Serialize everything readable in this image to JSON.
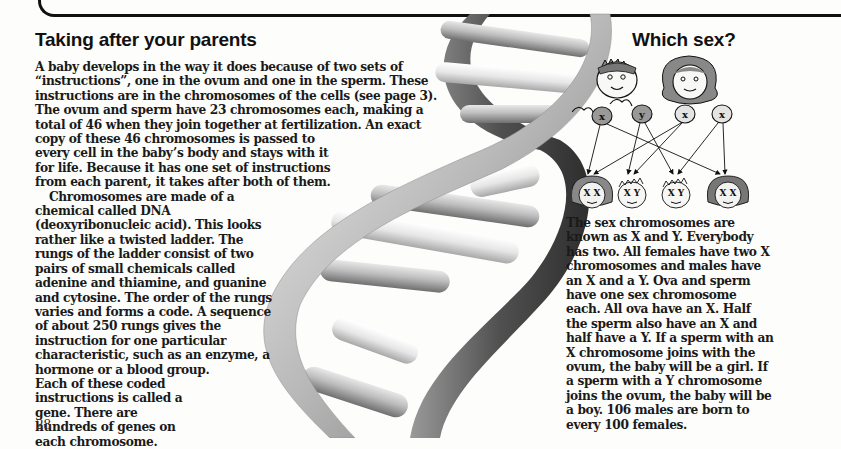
{
  "page": {
    "page_number": "28"
  },
  "main_article": {
    "heading": "Taking after your parents",
    "lines": [
      "A baby develops in the way it does because of two sets of",
      "“instructions”, one in the ovum and one in the sperm. These",
      "instructions are in the chromosomes of the cells (see page 3).",
      "The ovum and sperm have 23 chromosomes each, making a",
      "total of 46 when they join together at fertilization. An exact",
      "copy of these 46 chromosomes is passed to",
      "every cell in the baby’s body and stays with it",
      "for life. Because it has one set of instructions",
      "from each parent, it takes after both of them.",
      "Chromosomes are made of a",
      "chemical called DNA",
      "(deoxyribonucleic acid). This looks",
      "rather like a twisted ladder. The",
      "rungs of the ladder consist of two",
      "pairs of small chemicals called",
      "adenine and thiamine, and guanine",
      "and cytosine. The order of the rungs",
      "varies and forms a code. A sequence",
      "of about 250 rungs gives the",
      "instruction for one particular",
      "characteristic, such as an enzyme, a",
      "hormone or a blood group.",
      "Each of these coded",
      "instructions is called a",
      "gene. There are",
      "hundreds of genes on",
      "each chromosome."
    ]
  },
  "sidebar": {
    "heading": "Which sex?",
    "diagram": {
      "parents": [
        "male-parent-face",
        "female-parent-face"
      ],
      "gametes": [
        {
          "type": "sperm",
          "label": "X"
        },
        {
          "type": "sperm",
          "label": "Y"
        },
        {
          "type": "ovum",
          "label": "X"
        },
        {
          "type": "ovum",
          "label": "X"
        }
      ],
      "children": [
        {
          "sex": "female",
          "label": "X X"
        },
        {
          "sex": "male",
          "label": "X Y"
        },
        {
          "sex": "male",
          "label": "X Y"
        },
        {
          "sex": "female",
          "label": "X X"
        }
      ]
    },
    "lines": [
      "The sex chromosomes are",
      "known as X and Y. Everybody",
      "has two. All females have two X",
      "chromosomes and males have",
      "an X and a Y. Ova and sperm",
      "have one sex chromosome",
      "each. All ova have an X. Half",
      "the sperm also have an X and",
      "half have a Y. If a sperm with an",
      "X chromosome joins with the",
      "ovum, the baby will be a girl. If",
      "a sperm with a Y chromosome",
      "joins the ovum, the baby will be",
      "a boy. 106 males are born to",
      "every 100 females."
    ]
  },
  "illustration": {
    "subject": "dna-double-helix"
  }
}
